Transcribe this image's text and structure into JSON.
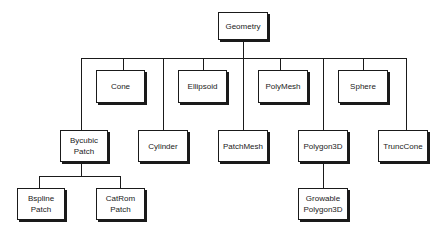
{
  "diagram": {
    "type": "class-hierarchy",
    "root": "Geometry",
    "nodes": {
      "geometry": "Geometry",
      "cone": "Cone",
      "ellipsoid": "Ellipsoid",
      "polymesh": "PolyMesh",
      "sphere": "Sphere",
      "bycubic_patch": "Bycubic\nPatch",
      "cylinder": "Cylinder",
      "patchmesh": "PatchMesh",
      "polygon3d": "Polygon3D",
      "trunccone": "TruncCone",
      "bspline_patch": "Bspline\nPatch",
      "catrom_patch": "CatRom\nPatch",
      "growable_polygon3d": "Growable\nPolygon3D"
    },
    "edges": [
      [
        "Geometry",
        "Cone"
      ],
      [
        "Geometry",
        "Ellipsoid"
      ],
      [
        "Geometry",
        "PolyMesh"
      ],
      [
        "Geometry",
        "Sphere"
      ],
      [
        "Geometry",
        "Bycubic Patch"
      ],
      [
        "Geometry",
        "Cylinder"
      ],
      [
        "Geometry",
        "PatchMesh"
      ],
      [
        "Geometry",
        "Polygon3D"
      ],
      [
        "Geometry",
        "TruncCone"
      ],
      [
        "Bycubic Patch",
        "Bspline Patch"
      ],
      [
        "Bycubic Patch",
        "CatRom Patch"
      ],
      [
        "Polygon3D",
        "Growable Polygon3D"
      ]
    ]
  }
}
